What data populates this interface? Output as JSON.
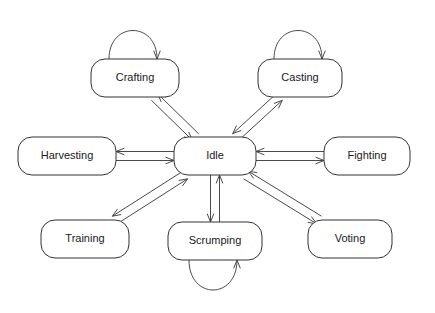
{
  "diagram": {
    "type": "state-machine-diagram",
    "title": "",
    "canvas": {
      "width": 435,
      "height": 313,
      "background": "#ffffff"
    },
    "style": {
      "node_fill": "#ffffff",
      "node_stroke": "#333333",
      "edge_stroke": "#4a4a4a",
      "label_color": "#1a1a1a",
      "node_corner_radius": 14,
      "stroke_width": 1
    },
    "nodes": [
      {
        "id": "crafting",
        "label": "Crafting",
        "cx": 135,
        "cy": 78,
        "w": 88,
        "h": 38,
        "self_loop": true,
        "loop_side": "top"
      },
      {
        "id": "casting",
        "label": "Casting",
        "cx": 300,
        "cy": 78,
        "w": 84,
        "h": 38,
        "self_loop": true,
        "loop_side": "top"
      },
      {
        "id": "harvesting",
        "label": "Harvesting",
        "cx": 67,
        "cy": 156,
        "w": 98,
        "h": 38,
        "self_loop": false,
        "loop_side": ""
      },
      {
        "id": "idle",
        "label": "Idle",
        "cx": 215,
        "cy": 156,
        "w": 82,
        "h": 38,
        "self_loop": false,
        "loop_side": ""
      },
      {
        "id": "fighting",
        "label": "Fighting",
        "cx": 367,
        "cy": 156,
        "w": 86,
        "h": 38,
        "self_loop": false,
        "loop_side": ""
      },
      {
        "id": "training",
        "label": "Training",
        "cx": 85,
        "cy": 239,
        "w": 88,
        "h": 38,
        "self_loop": false,
        "loop_side": ""
      },
      {
        "id": "scrumping",
        "label": "Scrumping",
        "cx": 215,
        "cy": 241,
        "w": 94,
        "h": 38,
        "self_loop": true,
        "loop_side": "bottom"
      },
      {
        "id": "voting",
        "label": "Voting",
        "cx": 350,
        "cy": 239,
        "w": 84,
        "h": 38,
        "self_loop": false,
        "loop_side": ""
      }
    ],
    "edges": [
      {
        "from": "idle",
        "to": "crafting",
        "bidirectional": true
      },
      {
        "from": "idle",
        "to": "casting",
        "bidirectional": true
      },
      {
        "from": "idle",
        "to": "harvesting",
        "bidirectional": true
      },
      {
        "from": "idle",
        "to": "fighting",
        "bidirectional": true
      },
      {
        "from": "idle",
        "to": "training",
        "bidirectional": true
      },
      {
        "from": "idle",
        "to": "scrumping",
        "bidirectional": true
      },
      {
        "from": "idle",
        "to": "voting",
        "bidirectional": true
      }
    ],
    "self_loops": [
      {
        "node": "crafting",
        "side": "top"
      },
      {
        "node": "casting",
        "side": "top"
      },
      {
        "node": "scrumping",
        "side": "bottom"
      }
    ]
  }
}
